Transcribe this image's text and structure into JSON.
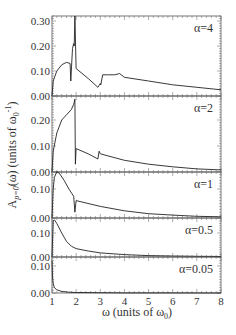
{
  "chart_data": {
    "type": "line",
    "title": "",
    "xlabel": "ω (units of ω0)",
    "ylabel": "A_{p=0}(ω) (units of ω0^-1)",
    "xlim": [
      1,
      8
    ],
    "x_ticks": [
      "1",
      "2",
      "3",
      "4",
      "5",
      "6",
      "7",
      "8"
    ],
    "layout": "5 vertically stacked panels sharing the x axis",
    "panels": [
      {
        "label": "α=4",
        "ylim": [
          0,
          0.32
        ],
        "y_ticks": [
          "0.00",
          "0.10",
          "0.20",
          "0.30"
        ],
        "x": [
          1.0,
          1.05,
          1.2,
          1.4,
          1.6,
          1.75,
          1.78,
          1.8,
          1.85,
          1.9,
          1.92,
          1.95,
          2.0,
          2.5,
          2.9,
          3.0,
          3.02,
          3.05,
          3.1,
          3.3,
          3.6,
          3.8,
          4.0,
          5.0,
          6.0,
          7.0,
          8.0
        ],
        "y": [
          0.0,
          0.06,
          0.1,
          0.125,
          0.135,
          0.13,
          0.06,
          0.1,
          0.19,
          0.21,
          0.2,
          0.32,
          0.11,
          0.07,
          0.035,
          0.05,
          0.045,
          0.06,
          0.085,
          0.085,
          0.085,
          0.09,
          0.075,
          0.06,
          0.045,
          0.035,
          0.025
        ]
      },
      {
        "label": "α=2",
        "ylim": [
          0,
          0.28
        ],
        "y_ticks": [
          "0.00",
          "0.10",
          "0.20"
        ],
        "x": [
          1.0,
          1.05,
          1.2,
          1.4,
          1.6,
          1.8,
          1.9,
          1.95,
          1.97,
          2.0,
          2.5,
          2.9,
          2.95,
          3.0,
          4.0,
          5.0,
          6.0,
          7.0,
          8.0
        ],
        "y": [
          0.0,
          0.08,
          0.15,
          0.2,
          0.22,
          0.24,
          0.26,
          0.28,
          0.03,
          0.09,
          0.07,
          0.05,
          0.08,
          0.07,
          0.045,
          0.03,
          0.02,
          0.012,
          0.008
        ]
      },
      {
        "label": "α=1",
        "ylim": [
          0,
          0.16
        ],
        "y_ticks": [
          "0.00",
          "0.10"
        ],
        "x": [
          1.0,
          1.05,
          1.1,
          1.2,
          1.3,
          1.5,
          1.7,
          1.9,
          1.95,
          2.0,
          3.0,
          4.0,
          5.0,
          6.0,
          7.0,
          8.0
        ],
        "y": [
          0.0,
          0.1,
          0.14,
          0.16,
          0.155,
          0.13,
          0.1,
          0.075,
          0.02,
          0.06,
          0.04,
          0.025,
          0.015,
          0.01,
          0.006,
          0.004
        ]
      },
      {
        "label": "α=0.5",
        "ylim": [
          0,
          0.16
        ],
        "y_ticks": [
          "0.00",
          "0.10"
        ],
        "x": [
          1.0,
          1.05,
          1.1,
          1.2,
          1.4,
          1.6,
          1.8,
          2.0,
          2.5,
          3.0,
          4.0,
          5.0,
          6.0,
          7.0,
          8.0
        ],
        "y": [
          0.0,
          0.15,
          0.155,
          0.14,
          0.1,
          0.065,
          0.045,
          0.035,
          0.025,
          0.017,
          0.01,
          0.006,
          0.004,
          0.003,
          0.002
        ]
      },
      {
        "label": "α=0.05",
        "ylim": [
          0,
          0.12
        ],
        "y_ticks": [
          "0.00",
          "0.10"
        ],
        "x": [
          1.0,
          1.02,
          1.05,
          1.1,
          1.2,
          1.4,
          1.7,
          2.0,
          3.0,
          4.0,
          6.0,
          8.0
        ],
        "y": [
          0.12,
          0.06,
          0.035,
          0.02,
          0.012,
          0.006,
          0.003,
          0.002,
          0.001,
          0.0005,
          0.0002,
          0.0001
        ]
      }
    ],
    "grid": false,
    "legend": "none (panel labels in top-right of each panel)"
  },
  "axes": {
    "xlabel_main": "ω (units of ω",
    "xlabel_sub": "0",
    "xlabel_end": ")",
    "ylabel_main": "A",
    "ylabel_sub": "p=0",
    "ylabel_rest": "(ω)  (units of  ω",
    "ylabel_sub2": "0",
    "ylabel_sup": "-1",
    "ylabel_end": ")"
  }
}
